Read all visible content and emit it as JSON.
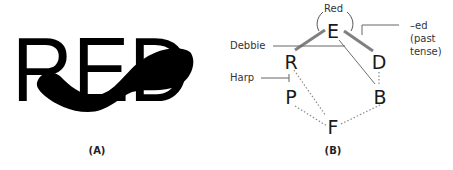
{
  "panel_a": {
    "word": "RED",
    "caption": "(A)"
  },
  "panel_b": {
    "caption": "(B)",
    "nodes": {
      "E": "E",
      "R": "R",
      "D": "D",
      "P": "P",
      "B": "B",
      "F": "F"
    },
    "labels": {
      "red": "Red",
      "debbie": "Debbie",
      "harp": "Harp",
      "ed_line1": "–ed",
      "ed_line2": "(past",
      "ed_line3": "tense)"
    },
    "edges": [
      {
        "from": "E",
        "to": "R",
        "style": "thick"
      },
      {
        "from": "E",
        "to": "D",
        "style": "thick"
      },
      {
        "from": "E",
        "to": "B",
        "style": "thin"
      },
      {
        "from": "R",
        "to": "P",
        "style": "inhibit"
      },
      {
        "from": "R",
        "to": "F",
        "style": "dotted"
      },
      {
        "from": "P",
        "to": "F",
        "style": "dotted"
      },
      {
        "from": "D",
        "to": "B",
        "style": "dotted"
      },
      {
        "from": "B",
        "to": "F",
        "style": "dotted"
      }
    ],
    "colors": {
      "thick_edge": "#808080",
      "thin_edge": "#707070",
      "dotted_edge": "#8a8a8a",
      "text": "#1a1a1a"
    }
  }
}
